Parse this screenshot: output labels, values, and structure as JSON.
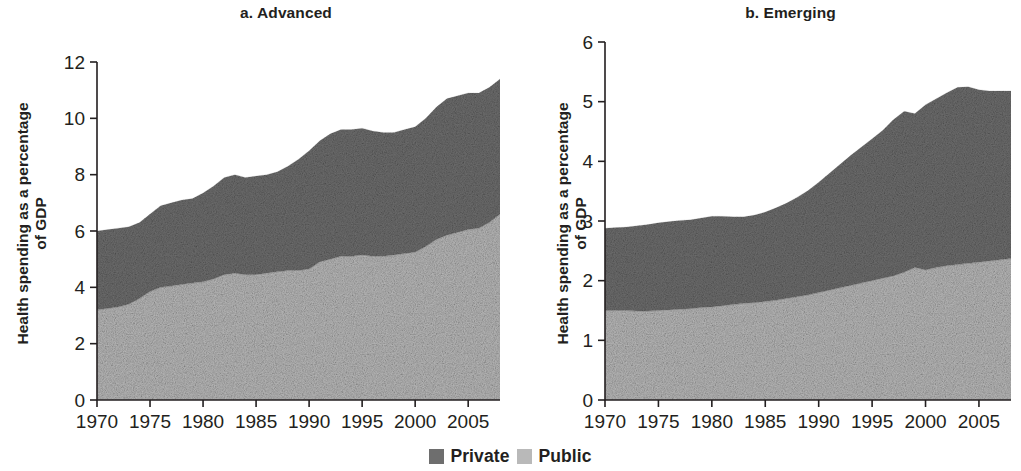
{
  "figure": {
    "ylabel_line1": "Health spending as a percentage",
    "ylabel_line2": "of GDP"
  },
  "legend": {
    "items": [
      {
        "label": "Private",
        "color": "#6e6e6e"
      },
      {
        "label": "Public",
        "color": "#b9b9b9"
      }
    ]
  },
  "chart_data": [
    {
      "type": "area",
      "panel_id": "a",
      "title": "a. Advanced",
      "xlabel": "",
      "ylabel": "Health spending as a percentage of GDP",
      "xlim": [
        1970,
        2008
      ],
      "ylim": [
        0,
        12
      ],
      "yticks": [
        0,
        2,
        4,
        6,
        8,
        10,
        12
      ],
      "xticks": [
        1970,
        1975,
        1980,
        1985,
        1990,
        1995,
        2000,
        2005
      ],
      "ytick_labels": [
        "0",
        "2",
        "4",
        "6",
        "8",
        "10",
        "12"
      ],
      "xtick_labels": [
        "1970",
        "1975",
        "1980",
        "1985",
        "1990",
        "1995",
        "2000",
        "2005"
      ],
      "grid": false,
      "legend_position": "bottom-center",
      "stacked": true,
      "x": [
        1970,
        1971,
        1972,
        1973,
        1974,
        1975,
        1976,
        1977,
        1978,
        1979,
        1980,
        1981,
        1982,
        1983,
        1984,
        1985,
        1986,
        1987,
        1988,
        1989,
        1990,
        1991,
        1992,
        1993,
        1994,
        1995,
        1996,
        1997,
        1998,
        1999,
        2000,
        2001,
        2002,
        2003,
        2004,
        2005,
        2006,
        2007,
        2008
      ],
      "series": [
        {
          "name": "Public",
          "color": "#b9b9b9",
          "values": [
            3.2,
            3.25,
            3.3,
            3.4,
            3.6,
            3.85,
            4.0,
            4.05,
            4.1,
            4.15,
            4.2,
            4.3,
            4.45,
            4.5,
            4.45,
            4.45,
            4.5,
            4.55,
            4.6,
            4.6,
            4.65,
            4.9,
            5.0,
            5.1,
            5.1,
            5.15,
            5.1,
            5.1,
            5.15,
            5.2,
            5.25,
            5.45,
            5.7,
            5.85,
            5.95,
            6.05,
            6.1,
            6.3,
            6.6,
            7.1
          ]
        },
        {
          "name": "Private",
          "color": "#6e6e6e",
          "values": [
            2.8,
            2.8,
            2.8,
            2.75,
            2.7,
            2.75,
            2.9,
            2.95,
            3.0,
            3.0,
            3.15,
            3.3,
            3.45,
            3.5,
            3.45,
            3.5,
            3.5,
            3.55,
            3.7,
            3.95,
            4.2,
            4.3,
            4.45,
            4.5,
            4.5,
            4.5,
            4.45,
            4.4,
            4.35,
            4.4,
            4.45,
            4.55,
            4.7,
            4.85,
            4.85,
            4.85,
            4.8,
            4.8,
            4.8,
            4.6
          ]
        }
      ],
      "totals": [
        6.0,
        6.05,
        6.1,
        6.15,
        6.3,
        6.6,
        6.9,
        7.0,
        7.1,
        7.15,
        7.35,
        7.6,
        7.9,
        8.0,
        7.9,
        7.95,
        8.0,
        8.1,
        8.3,
        8.55,
        8.85,
        9.2,
        9.45,
        9.6,
        9.6,
        9.65,
        9.55,
        9.5,
        9.5,
        9.6,
        9.7,
        10.0,
        10.4,
        10.7,
        10.8,
        10.9,
        10.9,
        11.1,
        11.4,
        11.7
      ]
    },
    {
      "type": "area",
      "panel_id": "b",
      "title": "b. Emerging",
      "xlabel": "",
      "ylabel": "Health spending as a percentage of GDP",
      "xlim": [
        1970,
        2008
      ],
      "ylim": [
        0,
        6
      ],
      "yticks": [
        0,
        1,
        2,
        3,
        4,
        5,
        6
      ],
      "xticks": [
        1970,
        1975,
        1980,
        1985,
        1990,
        1995,
        2000,
        2005
      ],
      "ytick_labels": [
        "0",
        "1",
        "2",
        "3",
        "4",
        "5",
        "6"
      ],
      "xtick_labels": [
        "1970",
        "1975",
        "1980",
        "1985",
        "1990",
        "1995",
        "2000",
        "2005"
      ],
      "grid": false,
      "legend_position": "bottom-center",
      "stacked": true,
      "x": [
        1970,
        1971,
        1972,
        1973,
        1974,
        1975,
        1976,
        1977,
        1978,
        1979,
        1980,
        1981,
        1982,
        1983,
        1984,
        1985,
        1986,
        1987,
        1988,
        1989,
        1990,
        1991,
        1992,
        1993,
        1994,
        1995,
        1996,
        1997,
        1998,
        1999,
        2000,
        2001,
        2002,
        2003,
        2004,
        2005,
        2006,
        2007,
        2008
      ],
      "series": [
        {
          "name": "Public",
          "color": "#b9b9b9",
          "values": [
            1.5,
            1.5,
            1.5,
            1.49,
            1.49,
            1.5,
            1.51,
            1.52,
            1.53,
            1.55,
            1.56,
            1.58,
            1.6,
            1.62,
            1.63,
            1.65,
            1.67,
            1.7,
            1.73,
            1.76,
            1.8,
            1.84,
            1.88,
            1.92,
            1.96,
            2.0,
            2.04,
            2.08,
            2.14,
            2.22,
            2.18,
            2.22,
            2.25,
            2.27,
            2.29,
            2.31,
            2.33,
            2.35,
            2.37,
            2.38
          ]
        },
        {
          "name": "Private",
          "color": "#6e6e6e",
          "values": [
            1.38,
            1.39,
            1.4,
            1.43,
            1.45,
            1.47,
            1.48,
            1.49,
            1.49,
            1.5,
            1.52,
            1.5,
            1.47,
            1.45,
            1.47,
            1.5,
            1.55,
            1.6,
            1.67,
            1.75,
            1.85,
            1.96,
            2.07,
            2.18,
            2.28,
            2.38,
            2.48,
            2.62,
            2.7,
            2.58,
            2.77,
            2.83,
            2.9,
            2.97,
            2.96,
            2.89,
            2.85,
            2.83,
            2.81,
            2.78
          ]
        }
      ],
      "totals": [
        2.88,
        2.89,
        2.9,
        2.92,
        2.94,
        2.97,
        2.99,
        3.01,
        3.02,
        3.05,
        3.08,
        3.08,
        3.07,
        3.07,
        3.1,
        3.15,
        3.22,
        3.3,
        3.4,
        3.51,
        3.65,
        3.8,
        3.95,
        4.1,
        4.24,
        4.38,
        4.52,
        4.7,
        4.84,
        4.8,
        4.95,
        5.05,
        5.15,
        5.24,
        5.25,
        5.2,
        5.18,
        5.18,
        5.18,
        5.16
      ]
    }
  ]
}
